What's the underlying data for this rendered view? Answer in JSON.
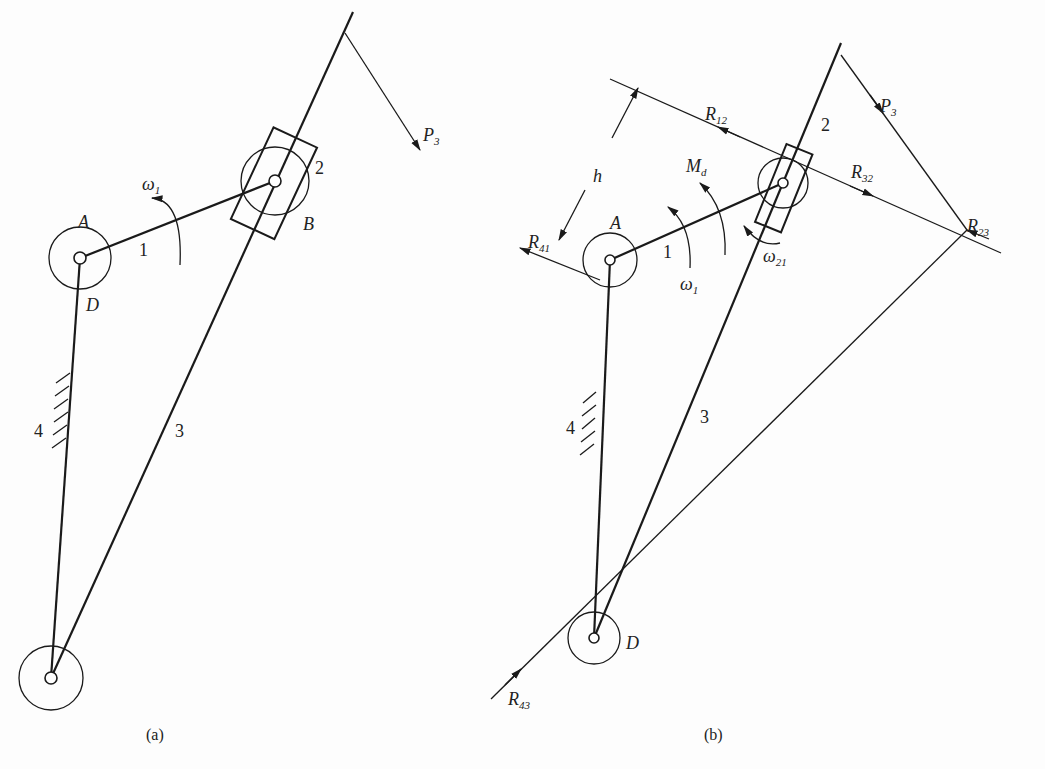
{
  "figure_a": {
    "caption": "(a)",
    "joints": {
      "A": "A",
      "B": "B",
      "D": "D"
    },
    "links": {
      "crank": "1",
      "slider": "2",
      "rocker": "3",
      "frame": "4"
    },
    "omega1": {
      "sym": "ω",
      "sub": "1"
    },
    "P3": {
      "sym": "P",
      "sub": "3"
    }
  },
  "figure_b": {
    "caption": "(b)",
    "joints": {
      "A": "A",
      "D": "D"
    },
    "links": {
      "crank": "1",
      "slider": "2",
      "rocker": "3",
      "frame": "4"
    },
    "h": "h",
    "omega1": {
      "sym": "ω",
      "sub": "1"
    },
    "omega21": {
      "sym": "ω",
      "sub": "21"
    },
    "Md": {
      "sym": "M",
      "sub": "d"
    },
    "P3": {
      "sym": "P",
      "sub": "3"
    },
    "R12": {
      "sym": "R",
      "sub": "12"
    },
    "R32": {
      "sym": "R",
      "sub": "32"
    },
    "R23": {
      "sym": "R",
      "sub": "23"
    },
    "R41": {
      "sym": "R",
      "sub": "41"
    },
    "R43": {
      "sym": "R",
      "sub": "43"
    }
  }
}
